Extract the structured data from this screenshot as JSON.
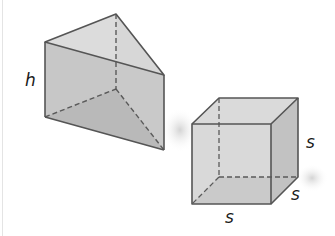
{
  "figure": {
    "colors": {
      "edge": "#5a5a5a",
      "face_top": "#d6d6d6",
      "face_front": "#bdbdbd",
      "face_side": "#c9c9c9",
      "face_base": "#9e9e9e",
      "cube_front": "#cfcfcf",
      "cube_top": "#d9d9d9",
      "cube_side": "#c2c2c2",
      "cube_base": "#b3b3b3",
      "label": "#1a1a1a"
    },
    "triangular_prism": {
      "height_label": "h"
    },
    "cube": {
      "side_label_right": "s",
      "side_label_depth": "s",
      "side_label_bottom": "s"
    }
  }
}
